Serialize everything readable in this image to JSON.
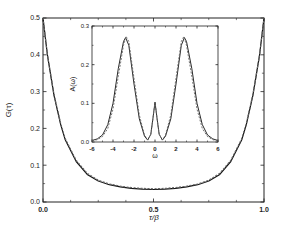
{
  "chart_data": [
    {
      "type": "line",
      "title": "",
      "xlabel": "τ/β",
      "ylabel": "G(τ)",
      "xlim": [
        0.0,
        1.0
      ],
      "ylim": [
        0.0,
        0.5
      ],
      "x_ticks": [
        "0.0",
        "0.5",
        "1.0"
      ],
      "y_ticks": [
        "0.0",
        "0.1",
        "0.2",
        "0.3",
        "0.4",
        "0.5"
      ],
      "grid": false,
      "legend": null,
      "series": [
        {
          "name": "solid",
          "style": "solid",
          "x": [
            0.0,
            0.02,
            0.05,
            0.08,
            0.1,
            0.15,
            0.2,
            0.25,
            0.3,
            0.35,
            0.4,
            0.45,
            0.5,
            0.55,
            0.6,
            0.65,
            0.7,
            0.75,
            0.8,
            0.85,
            0.9,
            0.92,
            0.95,
            0.98,
            1.0
          ],
          "y": [
            0.5,
            0.4,
            0.29,
            0.21,
            0.17,
            0.11,
            0.075,
            0.057,
            0.047,
            0.041,
            0.037,
            0.035,
            0.034,
            0.035,
            0.037,
            0.041,
            0.047,
            0.057,
            0.075,
            0.11,
            0.17,
            0.21,
            0.29,
            0.4,
            0.5
          ]
        },
        {
          "name": "dashed",
          "style": "dashed",
          "x": [
            0.0,
            0.02,
            0.05,
            0.08,
            0.1,
            0.15,
            0.2,
            0.25,
            0.3,
            0.35,
            0.4,
            0.45,
            0.5,
            0.55,
            0.6,
            0.65,
            0.7,
            0.75,
            0.8,
            0.85,
            0.9,
            0.92,
            0.95,
            0.98,
            1.0
          ],
          "y": [
            0.5,
            0.4,
            0.292,
            0.213,
            0.173,
            0.113,
            0.078,
            0.059,
            0.049,
            0.043,
            0.039,
            0.037,
            0.036,
            0.037,
            0.039,
            0.043,
            0.049,
            0.059,
            0.078,
            0.113,
            0.173,
            0.213,
            0.292,
            0.4,
            0.5
          ]
        }
      ]
    },
    {
      "type": "line",
      "title": "inset",
      "xlabel": "ω",
      "ylabel": "A(ω)",
      "xlim": [
        -6,
        6
      ],
      "ylim": [
        0.0,
        0.3
      ],
      "x_ticks": [
        "-6",
        "-4",
        "-2",
        "0",
        "2",
        "4",
        "6"
      ],
      "y_ticks": [
        "0.0",
        "0.1",
        "0.2",
        "0.3"
      ],
      "grid": false,
      "legend": null,
      "series": [
        {
          "name": "solid",
          "style": "solid",
          "x": [
            -6,
            -5.5,
            -5,
            -4.5,
            -4,
            -3.5,
            -3,
            -2.8,
            -2.5,
            -2,
            -1.5,
            -1,
            -0.7,
            -0.4,
            -0.2,
            0,
            0.2,
            0.4,
            0.7,
            1,
            1.5,
            2,
            2.5,
            2.8,
            3,
            3.5,
            4,
            4.5,
            5,
            5.5,
            6
          ],
          "y": [
            0.004,
            0.008,
            0.018,
            0.045,
            0.1,
            0.19,
            0.26,
            0.27,
            0.25,
            0.15,
            0.06,
            0.015,
            0.005,
            0.02,
            0.06,
            0.103,
            0.06,
            0.02,
            0.005,
            0.015,
            0.06,
            0.15,
            0.25,
            0.27,
            0.26,
            0.19,
            0.1,
            0.045,
            0.018,
            0.008,
            0.004
          ]
        },
        {
          "name": "dashed",
          "style": "dashed",
          "x": [
            -6,
            -5.5,
            -5,
            -4.5,
            -4,
            -3.5,
            -3,
            -2.75,
            -2.5,
            -2,
            -1.5,
            -1,
            -0.7,
            -0.4,
            -0.2,
            0,
            0.2,
            0.4,
            0.7,
            1,
            1.5,
            2,
            2.5,
            2.75,
            3,
            3.5,
            4,
            4.5,
            5,
            5.5,
            6
          ],
          "y": [
            0.003,
            0.006,
            0.014,
            0.035,
            0.085,
            0.17,
            0.25,
            0.273,
            0.26,
            0.165,
            0.07,
            0.018,
            0.006,
            0.02,
            0.06,
            0.103,
            0.06,
            0.02,
            0.006,
            0.018,
            0.07,
            0.165,
            0.26,
            0.273,
            0.25,
            0.17,
            0.085,
            0.035,
            0.014,
            0.006,
            0.003
          ]
        }
      ]
    }
  ],
  "main": {
    "xlabel": "τ/β",
    "ylabel": "G(τ)",
    "x_ticks": [
      {
        "v": 0.0,
        "label": "0.0"
      },
      {
        "v": 0.5,
        "label": "0.5"
      },
      {
        "v": 1.0,
        "label": "1.0"
      }
    ],
    "y_ticks": [
      {
        "v": 0.0,
        "label": "0.0"
      },
      {
        "v": 0.1,
        "label": "0.1"
      },
      {
        "v": 0.2,
        "label": "0.2"
      },
      {
        "v": 0.3,
        "label": "0.3"
      },
      {
        "v": 0.4,
        "label": "0.4"
      },
      {
        "v": 0.5,
        "label": "0.5"
      }
    ]
  },
  "inset": {
    "xlabel": "ω",
    "ylabel": "A(ω)",
    "x_ticks": [
      {
        "v": -6,
        "label": "-6"
      },
      {
        "v": -4,
        "label": "-4"
      },
      {
        "v": -2,
        "label": "-2"
      },
      {
        "v": 0,
        "label": "0"
      },
      {
        "v": 2,
        "label": "2"
      },
      {
        "v": 4,
        "label": "4"
      },
      {
        "v": 6,
        "label": "6"
      }
    ],
    "y_ticks": [
      {
        "v": 0.0,
        "label": "0.0"
      },
      {
        "v": 0.1,
        "label": "0.1"
      },
      {
        "v": 0.2,
        "label": "0.2"
      },
      {
        "v": 0.3,
        "label": "0.3"
      }
    ]
  }
}
